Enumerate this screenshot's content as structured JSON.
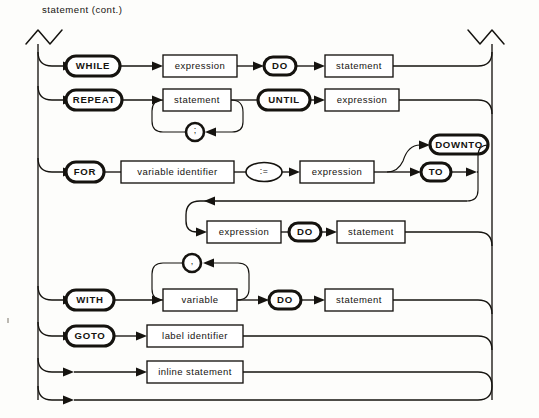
{
  "figure": {
    "caption": "statement (cont.)",
    "kind": "railroad-syntax-diagram",
    "ink_color": "#15130f",
    "paper_color": "#fdfdfb"
  },
  "nodes": {
    "while_kw": "WHILE",
    "while_expr": "expression",
    "while_do": "DO",
    "while_stmt": "statement",
    "repeat_kw": "REPEAT",
    "repeat_stmt": "statement",
    "repeat_sep": ";",
    "until_kw": "UNTIL",
    "until_expr": "expression",
    "for_kw": "FOR",
    "for_var": "variable identifier",
    "for_assign": ":=",
    "for_expr1": "expression",
    "downto_kw": "DOWNTO",
    "to_kw": "TO",
    "for_expr2": "expression",
    "for_do": "DO",
    "for_stmt": "statement",
    "with_kw": "WITH",
    "with_sep": ",",
    "with_var": "variable",
    "with_do": "DO",
    "with_stmt": "statement",
    "goto_kw": "GOTO",
    "goto_label": "label identifier",
    "inline_stmt": "inline statement"
  },
  "alternatives": [
    {
      "id": "while-branch",
      "sequence": [
        "WHILE",
        "expression",
        "DO",
        "statement"
      ]
    },
    {
      "id": "repeat-branch",
      "sequence": [
        "REPEAT",
        "statement",
        "UNTIL",
        "expression"
      ],
      "repetition": {
        "element": "statement",
        "separator": ";"
      }
    },
    {
      "id": "for-branch",
      "sequence": [
        "FOR",
        "variable identifier",
        ":=",
        "expression",
        "TO | DOWNTO",
        "expression",
        "DO",
        "statement"
      ],
      "choice": [
        "DOWNTO",
        "TO"
      ]
    },
    {
      "id": "with-branch",
      "sequence": [
        "WITH",
        "variable",
        "DO",
        "statement"
      ],
      "repetition": {
        "element": "variable",
        "separator": ","
      }
    },
    {
      "id": "goto-branch",
      "sequence": [
        "GOTO",
        "label identifier"
      ]
    },
    {
      "id": "inline-branch",
      "sequence": [
        "inline statement"
      ]
    },
    {
      "id": "empty-branch",
      "sequence": []
    }
  ],
  "continuation_markers": {
    "left": "zigzag-break",
    "right": "zigzag-break"
  }
}
